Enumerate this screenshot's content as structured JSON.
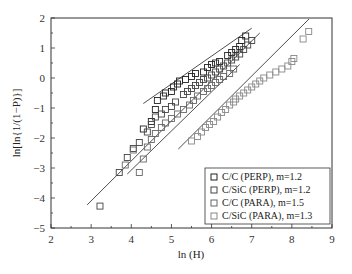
{
  "chart_data": {
    "type": "scatter",
    "title": "",
    "xlabel": "ln (H)",
    "ylabel": "ln[ln{1/(1−P)}]",
    "xlim": [
      2,
      9
    ],
    "ylim": [
      -5,
      2
    ],
    "xticks": [
      "2",
      "3",
      "4",
      "5",
      "6",
      "7",
      "8",
      "9"
    ],
    "yticks": [
      "2",
      "1",
      "0",
      "−1",
      "−2",
      "−3",
      "−4",
      "−5"
    ],
    "grid": false,
    "legend_position": "lower right",
    "series": [
      {
        "name": "C/C (PERP), m=1.2",
        "color": "#222222",
        "marker": "square-open",
        "fit_line": [
          [
            4.3,
            -0.85
          ],
          [
            7.0,
            1.66
          ]
        ],
        "points": [
          [
            4.3,
            -1.7
          ],
          [
            4.5,
            -1.45
          ],
          [
            4.6,
            -1.05
          ],
          [
            4.65,
            -0.75
          ],
          [
            4.8,
            -0.6
          ],
          [
            4.85,
            -0.5
          ],
          [
            5.0,
            -0.45
          ],
          [
            5.05,
            -0.3
          ],
          [
            5.15,
            -0.2
          ],
          [
            5.2,
            -0.1
          ],
          [
            5.35,
            -0.05
          ],
          [
            5.5,
            0.05
          ],
          [
            5.6,
            0.15
          ],
          [
            5.8,
            0.2
          ],
          [
            5.9,
            0.35
          ],
          [
            6.0,
            0.45
          ],
          [
            6.1,
            0.5
          ],
          [
            6.2,
            0.55
          ],
          [
            6.4,
            0.75
          ],
          [
            6.5,
            0.85
          ],
          [
            6.6,
            0.95
          ],
          [
            6.7,
            1.05
          ],
          [
            6.75,
            1.25
          ],
          [
            6.85,
            1.4
          ]
        ]
      },
      {
        "name": "C/SiC (PERP), m=1.2",
        "color": "#444444",
        "marker": "square-open",
        "fit_line": [
          [
            2.9,
            -4.23
          ],
          [
            7.2,
            1.5
          ]
        ],
        "points": [
          [
            3.22,
            -4.27
          ],
          [
            3.7,
            -3.15
          ],
          [
            3.9,
            -2.65
          ],
          [
            4.05,
            -2.35
          ],
          [
            4.2,
            -2.15
          ],
          [
            4.4,
            -1.8
          ],
          [
            4.5,
            -1.55
          ],
          [
            4.6,
            -1.3
          ],
          [
            4.75,
            -1.2
          ],
          [
            4.85,
            -1.05
          ],
          [
            5.0,
            -0.95
          ],
          [
            5.1,
            -0.8
          ],
          [
            5.3,
            -0.55
          ],
          [
            5.4,
            -0.45
          ],
          [
            5.5,
            -0.35
          ],
          [
            5.6,
            -0.25
          ],
          [
            5.7,
            -0.15
          ],
          [
            5.8,
            -0.05
          ],
          [
            5.9,
            0.0
          ],
          [
            6.0,
            0.1
          ],
          [
            6.1,
            0.2
          ],
          [
            6.2,
            0.3
          ],
          [
            6.3,
            0.4
          ],
          [
            6.4,
            0.5
          ],
          [
            6.5,
            0.6
          ],
          [
            6.6,
            0.7
          ],
          [
            6.7,
            0.8
          ],
          [
            6.8,
            0.95
          ],
          [
            6.9,
            1.1
          ],
          [
            7.0,
            1.25
          ]
        ]
      },
      {
        "name": "C/C (PARA), m=1.5",
        "color": "#666666",
        "marker": "square-open",
        "fit_line": [
          [
            3.9,
            -3.2
          ],
          [
            6.7,
            0.45
          ]
        ],
        "points": [
          [
            3.85,
            -2.9
          ],
          [
            4.05,
            -2.4
          ],
          [
            4.2,
            -3.15
          ],
          [
            4.3,
            -2.7
          ],
          [
            4.4,
            -2.3
          ],
          [
            4.5,
            -2.05
          ],
          [
            4.6,
            -1.85
          ],
          [
            4.75,
            -1.65
          ],
          [
            4.85,
            -1.5
          ],
          [
            5.0,
            -1.35
          ],
          [
            5.15,
            -1.2
          ],
          [
            5.3,
            -1.05
          ],
          [
            5.45,
            -0.9
          ],
          [
            5.55,
            -0.75
          ],
          [
            5.65,
            -0.6
          ],
          [
            5.8,
            -0.45
          ],
          [
            5.9,
            -0.35
          ],
          [
            6.0,
            -0.25
          ],
          [
            6.1,
            -0.15
          ],
          [
            6.2,
            -0.05
          ],
          [
            6.3,
            0.05
          ],
          [
            6.45,
            0.15
          ],
          [
            6.55,
            0.3
          ]
        ]
      },
      {
        "name": "C/SiC (PARA), m=1.3",
        "color": "#888888",
        "marker": "square-open",
        "fit_line": [
          [
            5.17,
            -2.37
          ],
          [
            8.43,
            1.97
          ]
        ],
        "points": [
          [
            5.5,
            -2.1
          ],
          [
            5.65,
            -1.95
          ],
          [
            5.75,
            -1.8
          ],
          [
            5.85,
            -1.65
          ],
          [
            5.95,
            -1.55
          ],
          [
            6.05,
            -1.45
          ],
          [
            6.15,
            -1.3
          ],
          [
            6.25,
            -1.15
          ],
          [
            6.35,
            -1.05
          ],
          [
            6.45,
            -0.9
          ],
          [
            6.55,
            -0.8
          ],
          [
            6.6,
            -0.7
          ],
          [
            6.7,
            -0.6
          ],
          [
            6.8,
            -0.5
          ],
          [
            6.9,
            -0.4
          ],
          [
            7.0,
            -0.3
          ],
          [
            7.1,
            -0.2
          ],
          [
            7.2,
            -0.1
          ],
          [
            7.3,
            0.0
          ],
          [
            7.45,
            0.1
          ],
          [
            7.6,
            0.2
          ],
          [
            7.75,
            0.3
          ],
          [
            7.9,
            0.4
          ],
          [
            8.0,
            0.55
          ],
          [
            8.05,
            0.65
          ],
          [
            8.28,
            1.3
          ],
          [
            8.42,
            1.55
          ]
        ]
      }
    ]
  },
  "axes": {
    "xlabel": "ln (H)",
    "ylabel": "ln[ln{1/(1−P)}]"
  },
  "legend": {
    "items": [
      {
        "label": "C/C (PERP), m=1.2",
        "color": "#222222"
      },
      {
        "label": "C/SiC (PERP), m=1.2",
        "color": "#444444"
      },
      {
        "label": "C/C (PARA), m=1.5",
        "color": "#666666"
      },
      {
        "label": "C/SiC (PARA), m=1.3",
        "color": "#888888"
      }
    ]
  }
}
